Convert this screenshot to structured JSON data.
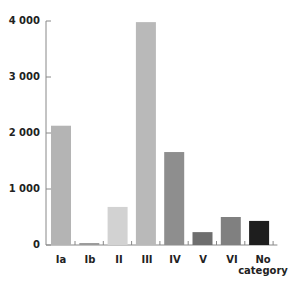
{
  "chart_data": {
    "type": "bar",
    "title": "",
    "xlabel": "",
    "ylabel": "",
    "categories": [
      "Ia",
      "Ib",
      "II",
      "III",
      "IV",
      "V",
      "VI",
      "No category"
    ],
    "values": [
      2130,
      35,
      680,
      3980,
      1660,
      230,
      500,
      430
    ],
    "colors": [
      "#b4b4b4",
      "#9a9a9a",
      "#d2d2d2",
      "#b9b9b9",
      "#8e8e8e",
      "#6e6e6e",
      "#808080",
      "#1e1e1e"
    ],
    "ylim": [
      0,
      4000
    ],
    "yticks": [
      0,
      1000,
      2000,
      3000,
      4000
    ],
    "ytick_labels": [
      "0",
      "1 000",
      "2 000",
      "3 000",
      "4 000"
    ],
    "grid": false,
    "legend": "none"
  },
  "axis": {
    "ytick_0": "0",
    "ytick_1": "1 000",
    "ytick_2": "2 000",
    "ytick_3": "3 000",
    "ytick_4": "4 000"
  },
  "labels": {
    "c0": "Ia",
    "c1": "Ib",
    "c2": "II",
    "c3": "III",
    "c4": "IV",
    "c5": "V",
    "c6": "VI",
    "c7_line1": "No",
    "c7_line2": "category"
  }
}
